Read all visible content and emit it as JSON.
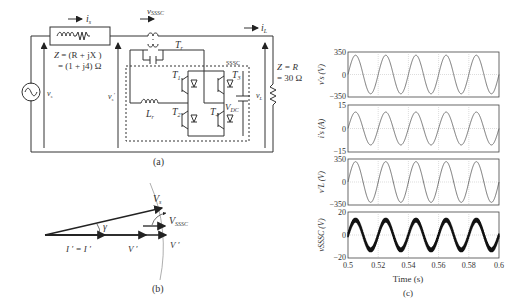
{
  "panel_a": {
    "caption": "(a)",
    "labels": {
      "i_s": "i",
      "i_s_sub": "s",
      "v_sssc": "v",
      "v_sssc_sub": "SSSC",
      "i_L": "i",
      "i_L_sub": "L",
      "Zs_line1": "Z",
      "Zs_line1_rest": " = (R  + jX )",
      "Zs_line2": "= (1 + j4) Ω",
      "Tr": "T",
      "Tr_sub": "r",
      "sssc_box": "SSSC",
      "T1": "T",
      "T1_sub": "1",
      "T2": "T",
      "T2_sub": "2",
      "T3": "T",
      "T3_sub": "3",
      "T4": "T",
      "T4_sub": "4",
      "Lr": "L",
      "Lr_sub": "r",
      "Vdc": "V",
      "Vdc_sub": "DC",
      "vs": "v",
      "vs_sub": "s",
      "vs_prime": "v",
      "vs_prime_sub": "s",
      "vL": "v",
      "vL_sub": "L",
      "ZL_line1": "Z  = R",
      "ZL_line2": "= 30 Ω"
    }
  },
  "panel_b": {
    "caption": "(b)",
    "labels": {
      "Vs": "V",
      "Vs_sub": "s",
      "V_sssc": "V",
      "V_sssc_sub": "SSSC",
      "gamma": "γ",
      "Is_eq_IL": "I ′ = I ′",
      "Vs_prime": "V ′",
      "VL_prime": "V ′"
    }
  },
  "panel_c": {
    "caption": "(c)"
  },
  "chart_data": [
    {
      "type": "line",
      "ylabel": "v′s (V)",
      "ylim": [
        -350,
        350
      ],
      "yticks": [
        "350",
        "0",
        "−350"
      ],
      "xlim": [
        0.5,
        0.6
      ],
      "grid": true,
      "amplitude": 300,
      "frequency_hz": 50,
      "phase_deg": 0
    },
    {
      "type": "line",
      "ylabel": "i′s (A)",
      "ylim": [
        -15,
        15
      ],
      "yticks": [
        "15",
        "0",
        "−15"
      ],
      "xlim": [
        0.5,
        0.6
      ],
      "grid": true,
      "amplitude": 10.5,
      "frequency_hz": 50,
      "phase_deg": 0
    },
    {
      "type": "line",
      "ylabel": "v′L (V)",
      "ylim": [
        -350,
        350
      ],
      "yticks": [
        "350",
        "0",
        "−350"
      ],
      "xlim": [
        0.5,
        0.6
      ],
      "grid": true,
      "amplitude": 310,
      "frequency_hz": 50,
      "phase_deg": 0
    },
    {
      "type": "line",
      "ylabel": "vSSSC (V)",
      "ylim": [
        -20,
        20
      ],
      "yticks": [
        "20",
        "0",
        "−20"
      ],
      "xlim": [
        0.5,
        0.6
      ],
      "xticks": [
        "0.5",
        "0.52",
        "0.54",
        "0.56",
        "0.58",
        "0.6"
      ],
      "xlabel": "Time (s)",
      "grid": true,
      "amplitude": 13,
      "ripple": 2,
      "frequency_hz": 50,
      "phase_deg": 0
    }
  ]
}
